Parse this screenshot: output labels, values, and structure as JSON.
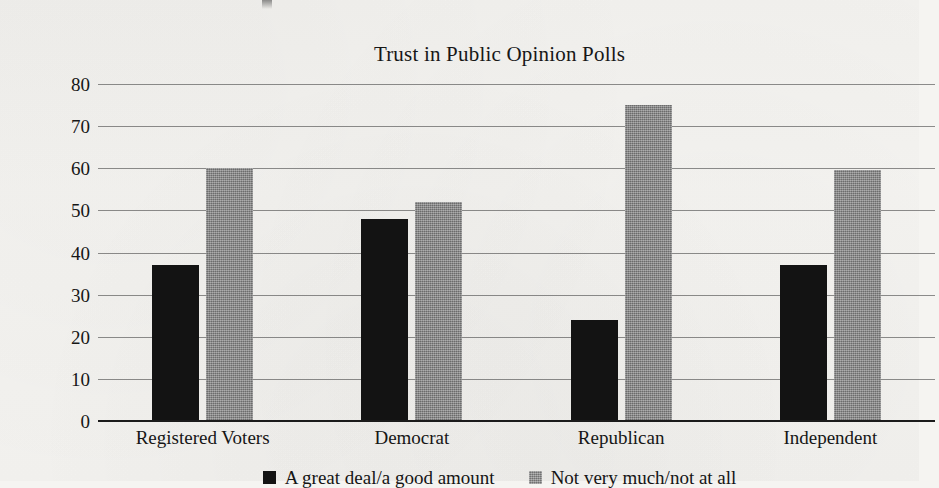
{
  "chart_data": {
    "type": "bar",
    "title": "Trust in Public Opinion Polls",
    "xlabel": "",
    "ylabel": "",
    "categories": [
      "Registered Voters",
      "Democrat",
      "Republican",
      "Independent"
    ],
    "series": [
      {
        "name": "A great deal/a good amount",
        "color": "#131313",
        "values": [
          37,
          48,
          24,
          37
        ]
      },
      {
        "name": "Not very much/not at all",
        "color": "#848484",
        "values": [
          60,
          52,
          75,
          59.5
        ]
      }
    ],
    "ylim": [
      0,
      80
    ],
    "ytick_labels": [
      "80",
      "70",
      "60",
      "50",
      "40",
      "30",
      "20",
      "10",
      "0"
    ],
    "ytick_values": [
      80,
      70,
      60,
      50,
      40,
      30,
      20,
      10,
      0
    ],
    "grid": true,
    "legend_position": "bottom-center"
  }
}
